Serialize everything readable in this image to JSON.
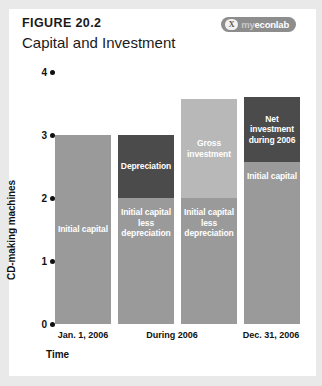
{
  "figure": {
    "number": "FIGURE 20.2",
    "title": "Capital and Investment",
    "brand_mark": "X",
    "brand_prefix": "my",
    "brand_name": "econlab"
  },
  "chart_data": {
    "type": "bar",
    "title": "Capital and Investment",
    "xlabel": "Time",
    "ylabel": "CD-making machines",
    "ylim": [
      0,
      4
    ],
    "yticks": [
      0,
      1,
      2,
      3,
      4
    ],
    "ytick_labels": [
      "0",
      "1",
      "2",
      "3",
      "4"
    ],
    "grid": false,
    "legend": "none",
    "stacked": true,
    "categories": [
      "Jan. 1, 2006",
      "During 2006",
      "Dec. 31, 2006"
    ],
    "bars": [
      {
        "column": 0,
        "category": "Jan. 1, 2006",
        "total": 3,
        "segments": [
          {
            "label": "Initial capital",
            "y0": 0,
            "y1": 3,
            "value": 3,
            "color": "#9a9a9a",
            "label_position": "center"
          }
        ]
      },
      {
        "column": 1,
        "category": "During 2006",
        "total": 3,
        "segments": [
          {
            "label": "Initial capital less depreciation",
            "y0": 0,
            "y1": 2,
            "value": 2,
            "color": "#9a9a9a",
            "label_position": "top"
          },
          {
            "label": "Depreciation",
            "y0": 2,
            "y1": 3,
            "value": 1,
            "color": "#4b4b4b",
            "label_position": "center"
          }
        ]
      },
      {
        "column": 2,
        "category": "During 2006",
        "total": 3.57,
        "segments": [
          {
            "label": "Initial capital less depreciation",
            "y0": 0,
            "y1": 2,
            "value": 2,
            "color": "#9a9a9a",
            "label_position": "top"
          },
          {
            "label": "Gross investment",
            "y0": 2,
            "y1": 3.57,
            "value": 1.57,
            "color": "#b8b8b8",
            "label_position": "center"
          }
        ]
      },
      {
        "column": 3,
        "category": "Dec. 31, 2006",
        "total": 3.6,
        "segments": [
          {
            "label": "Initial capital",
            "y0": 0,
            "y1": 2.57,
            "value": 2.57,
            "color": "#9a9a9a",
            "label_position": "top"
          },
          {
            "label": "Net investment during 2006",
            "y0": 2.57,
            "y1": 3.6,
            "value": 1.03,
            "color": "#4b4b4b",
            "label_position": "center"
          }
        ]
      }
    ]
  },
  "colors": {
    "capital_grey": "#9a9a9a",
    "depreciation_dark": "#4b4b4b",
    "gross_investment_light": "#b8b8b8",
    "brand_badge": "#8d8d8d",
    "axis_text": "#111111",
    "page_margin": "#e9e9e9"
  }
}
